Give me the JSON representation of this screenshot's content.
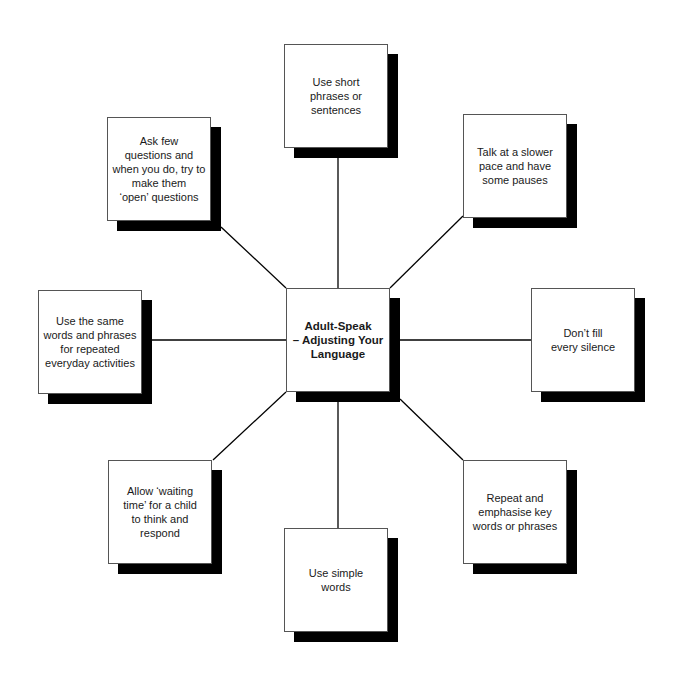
{
  "diagram": {
    "type": "hub-and-spoke",
    "center": {
      "label": "Adult-Speak\n– Adjusting Your Language",
      "line1": "Adult-Speak",
      "line2": "– Adjusting Your",
      "line3": "Language"
    },
    "nodes": [
      {
        "id": "top",
        "lines": [
          "Use short",
          "phrases or",
          "sentences"
        ]
      },
      {
        "id": "top-left",
        "lines": [
          "Ask few",
          "questions and",
          "when you do, try to",
          "make them",
          "‘open’ questions"
        ]
      },
      {
        "id": "top-right",
        "lines": [
          "Talk at a slower",
          "pace and have",
          "some pauses"
        ]
      },
      {
        "id": "left",
        "lines": [
          "Use the same",
          "words and phrases",
          "for repeated",
          "everyday activities"
        ]
      },
      {
        "id": "right",
        "lines": [
          "Don’t fill",
          "every silence"
        ]
      },
      {
        "id": "bottom-left",
        "lines": [
          "Allow ‘waiting",
          "time’ for a child",
          "to think and",
          "respond"
        ]
      },
      {
        "id": "bottom",
        "lines": [
          "Use simple",
          "words"
        ]
      },
      {
        "id": "bottom-right",
        "lines": [
          "Repeat and",
          "emphasise key",
          "words or phrases"
        ]
      }
    ],
    "colors": {
      "background": "#ffffff",
      "box_fill": "#ffffff",
      "box_border": "#555555",
      "shadow": "#000000",
      "connector": "#000000",
      "text": "#1a1a1a"
    }
  }
}
